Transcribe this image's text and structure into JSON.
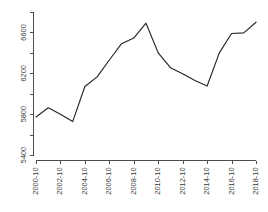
{
  "chart_data": {
    "type": "line",
    "title": "",
    "subtitle": "",
    "xlabel": "",
    "ylabel": "",
    "grid": false,
    "legend": null,
    "legend_position": "none",
    "line_color": "#262626",
    "axis_color": "#4d4d4d",
    "background_color": "#ffffff",
    "xlim": [
      2000.79,
      2018.79
    ],
    "ylim": [
      5400,
      6800
    ],
    "y_ticks": [
      5400,
      5600,
      5800,
      6000,
      6200,
      6400,
      6600,
      6800
    ],
    "y_tick_labels": [
      "5400",
      "",
      "5800",
      "",
      "6200",
      "",
      "6600",
      ""
    ],
    "y_labeled_ticks": [
      "5400",
      "5800",
      "6200",
      "6600"
    ],
    "x_ticks": [
      "2000-10",
      "2002-10",
      "2004-10",
      "2006-10",
      "2008-10",
      "2010-10",
      "2012-10",
      "2014-10",
      "2016-10",
      "2018-10"
    ],
    "x": [
      "2000-10",
      "2001-10",
      "2002-10",
      "2003-10",
      "2004-10",
      "2005-10",
      "2006-10",
      "2007-10",
      "2008-10",
      "2009-10",
      "2010-10",
      "2011-10",
      "2012-10",
      "2013-10",
      "2014-10",
      "2015-10",
      "2016-10",
      "2017-10",
      "2018-10"
    ],
    "values": [
      5772,
      5862,
      5800,
      5727,
      6070,
      6165,
      6330,
      6490,
      6545,
      6690,
      6400,
      6255,
      6195,
      6130,
      6075,
      6400,
      6590,
      6595,
      6700
    ]
  }
}
